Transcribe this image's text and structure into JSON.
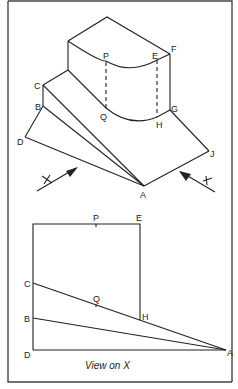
{
  "figure": {
    "isometric_view": {
      "labels": {
        "P": "P",
        "E": "E",
        "F": "F",
        "C": "C",
        "B": "B",
        "Q": "Q",
        "H": "H",
        "G": "G",
        "D": "D",
        "J": "J",
        "A": "A"
      },
      "view_arrows": {
        "x_label": "X",
        "y_label": "Y"
      }
    },
    "view_on_x": {
      "labels": {
        "P": "P",
        "E": "E",
        "C": "C",
        "Q": "Q",
        "H": "H",
        "B": "B",
        "D": "D",
        "A": "A"
      },
      "caption": "View on X"
    }
  }
}
